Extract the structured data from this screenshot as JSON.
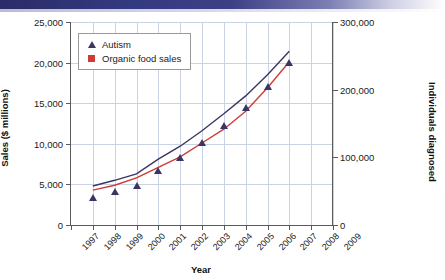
{
  "banner": {
    "name": "header-gradient-bar"
  },
  "chart_data": {
    "type": "line",
    "title": "",
    "xlabel": "Year",
    "ylabel": "Sales ($ millions)",
    "ylabel_right": "Individuals diagnosed",
    "grid": true,
    "legend_position": "top-left",
    "x": [
      1998,
      1999,
      2000,
      2001,
      2002,
      2003,
      2004,
      2005,
      2006,
      2007
    ],
    "xtick_labels": [
      "1997",
      "1998",
      "1999",
      "2000",
      "2001",
      "2002",
      "2003",
      "2004",
      "2005",
      "2006",
      "2007",
      "2008",
      "2009"
    ],
    "xlim": [
      1997,
      2009
    ],
    "ytick_labels_left": [
      "0",
      "5,000",
      "10,000",
      "15,000",
      "20,000",
      "25,000"
    ],
    "ytick_values_left": [
      0,
      5000,
      10000,
      15000,
      20000,
      25000
    ],
    "ylim": [
      0,
      25000
    ],
    "ytick_labels_right": [
      "0",
      "100,000",
      "200,000",
      "300,000"
    ],
    "ytick_values_right": [
      0,
      100000,
      200000,
      300000
    ],
    "ylim_right": [
      0,
      300000
    ],
    "series": [
      {
        "name": "Autism",
        "axis": "right",
        "color": "#3b3566",
        "marker": "triangle",
        "values": [
          4800,
          5500,
          6300,
          8100,
          9700,
          11600,
          13700,
          15900,
          18500,
          21400
        ],
        "values_axis_units": [
          57600,
          66000,
          75600,
          97200,
          116400,
          139200,
          164400,
          190800,
          222000,
          256800
        ]
      },
      {
        "name": "Organic food sales",
        "axis": "left",
        "color": "#cf3b36",
        "marker": "square",
        "values": [
          4300,
          4900,
          5800,
          7100,
          8400,
          10100,
          11800,
          14000,
          16900,
          20100
        ]
      }
    ]
  },
  "legend": {
    "items": [
      {
        "label": "Autism",
        "marker": "triangle",
        "color": "#3b3566"
      },
      {
        "label": "Organic food sales",
        "marker": "square",
        "color": "#cf3b36"
      }
    ]
  }
}
